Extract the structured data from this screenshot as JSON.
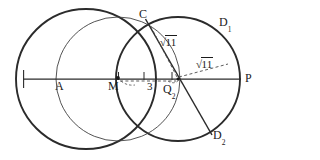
{
  "figure": {
    "type": "geometry-diagram",
    "background": "#ffffff",
    "stroke_color": "#2b2b2b",
    "thin_stroke_color": "#3a3a3a",
    "dashed_color": "#4a4a4a",
    "canvas": {
      "width": 266,
      "height": 160
    }
  },
  "points": {
    "A": {
      "label": "A",
      "x": 88,
      "y": 79,
      "label_x": 55,
      "label_y": 86
    },
    "M": {
      "label": "M",
      "x": 118,
      "y": 79,
      "label_x": 110,
      "label_y": 86
    },
    "Q2": {
      "label": "Q",
      "sub": "2",
      "x": 178,
      "y": 79,
      "label_x": 165,
      "label_y": 86
    },
    "P": {
      "label": "P",
      "x": 240,
      "y": 79,
      "label_x": 244,
      "label_y": 73
    },
    "C": {
      "label": "C",
      "x": 148,
      "y": 22,
      "label_x": 140,
      "label_y": 9
    },
    "D1": {
      "label": "D",
      "sub": "1",
      "x": 218,
      "y": 30,
      "label_x": 220,
      "label_y": 14
    },
    "D2": {
      "label": "D",
      "sub": "2",
      "x": 210,
      "y": 132,
      "label_x": 213,
      "label_y": 128
    }
  },
  "labels": {
    "A": "A",
    "M": "M",
    "Q2_base": "Q",
    "Q2_sub": "2",
    "P": "P",
    "C": "C",
    "D1_base": "D",
    "D1_sub": "1",
    "D2_base": "D",
    "D2_sub": "2",
    "segment_MQ2": "3",
    "radical_upper_radicand": "11",
    "radical_lower_radicand": "11",
    "radical_symbol": "√"
  },
  "measurements": [
    {
      "name": "MQ2",
      "value": "3",
      "from": "M",
      "to": "Q2",
      "style": "dashed-with-ticks"
    },
    {
      "name": "Q2C",
      "value": "√11",
      "from": "Q2",
      "to": "C",
      "style": "dashed"
    },
    {
      "name": "Q2D1",
      "value": "√11",
      "from": "Q2",
      "to": "D1",
      "style": "dashed"
    }
  ],
  "shapes": {
    "circle_left": {
      "cx": 86,
      "cy": 79,
      "r": 70,
      "weight": "bold"
    },
    "circle_right": {
      "cx": 178,
      "cy": 79,
      "r": 62,
      "weight": "bold"
    },
    "circle_mid": {
      "cx": 118,
      "cy": 79,
      "r": 62,
      "weight": "thin"
    },
    "line_horizontal": {
      "x1": 23,
      "y1": 79,
      "x2": 241,
      "y2": 79
    },
    "line_chord": {
      "x1": 146,
      "y1": 20,
      "x2": 212,
      "y2": 134
    }
  }
}
